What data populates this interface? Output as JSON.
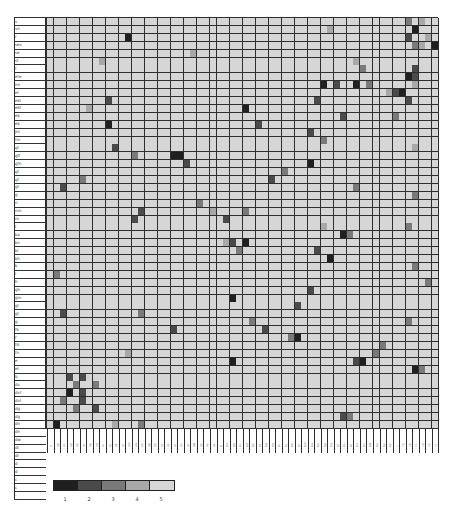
{
  "chart_data": {
    "type": "heatmap",
    "title": "",
    "xlabel": "",
    "ylabel": "",
    "n_rows": 52,
    "n_cols": 60,
    "default_value": 5,
    "row_labels": [
      "s",
      "vn",
      "r",
      "sev",
      "se",
      "st",
      "t",
      "ete",
      "nn",
      "el",
      "ekl",
      "ekt",
      "ek",
      "ek",
      "jm",
      "tm",
      "gl",
      "gfl",
      "gfn",
      "gt",
      "gt",
      "gt",
      "g",
      "n",
      "mn",
      "m",
      "l",
      "ka",
      "kn",
      "kl",
      "kh",
      "k",
      "i",
      "h",
      "gh",
      "gm",
      "gl",
      "gt",
      "g",
      "fk",
      "f",
      "fd",
      "fn",
      "e",
      "el",
      "b",
      "dv",
      "dvt",
      "dvl",
      "dg",
      "dg",
      "dn"
    ],
    "extra_row_labels": [
      "dn",
      "dw",
      "dl",
      "di",
      "d",
      "d",
      "c",
      "c",
      "-"
    ],
    "col_labels": [
      "a",
      "ab",
      "ac",
      "ad",
      "ae",
      "af",
      "ag",
      "ah",
      "ai",
      "aj",
      "ak",
      "al",
      "am",
      "an",
      "ao",
      "ap",
      "aq",
      "ar",
      "as",
      "at",
      "au",
      "av",
      "aw",
      "ax",
      "ay",
      "az",
      "b",
      "ba",
      "bb",
      "bc",
      "bd",
      "be",
      "bf",
      "bg",
      "bh",
      "bi",
      "bj",
      "bk",
      "bl",
      "bm",
      "bn",
      "bo",
      "bp",
      "bq",
      "br",
      "bs",
      "bt",
      "bu",
      "bv",
      "bw",
      "bx",
      "by",
      "bz",
      "c",
      "ca",
      "cb",
      "cc",
      "cd",
      "ce",
      "cf"
    ],
    "legend": {
      "values": [
        1,
        2,
        3,
        4,
        5
      ],
      "labels": [
        "1",
        "2",
        "3",
        "4",
        "5"
      ],
      "colors": [
        "#1f1f1f",
        "#4a4a4a",
        "#7a7a7a",
        "#a8a8a8",
        "#d6d6d6"
      ]
    },
    "cells": [
      [
        0,
        55,
        3
      ],
      [
        0,
        57,
        4
      ],
      [
        1,
        56,
        1
      ],
      [
        1,
        43,
        4
      ],
      [
        2,
        12,
        1
      ],
      [
        2,
        55,
        2
      ],
      [
        2,
        58,
        4
      ],
      [
        3,
        59,
        1
      ],
      [
        3,
        57,
        4
      ],
      [
        3,
        56,
        3
      ],
      [
        4,
        22,
        4
      ],
      [
        5,
        8,
        4
      ],
      [
        5,
        47,
        4
      ],
      [
        6,
        56,
        2
      ],
      [
        6,
        48,
        3
      ],
      [
        7,
        55,
        1
      ],
      [
        7,
        56,
        2
      ],
      [
        8,
        42,
        1
      ],
      [
        8,
        44,
        2
      ],
      [
        8,
        47,
        1
      ],
      [
        8,
        49,
        3
      ],
      [
        8,
        56,
        4
      ],
      [
        9,
        52,
        4
      ],
      [
        9,
        53,
        2
      ],
      [
        9,
        54,
        1
      ],
      [
        10,
        41,
        2
      ],
      [
        10,
        55,
        2
      ],
      [
        10,
        9,
        2
      ],
      [
        11,
        30,
        1
      ],
      [
        11,
        6,
        4
      ],
      [
        12,
        53,
        3
      ],
      [
        12,
        45,
        2
      ],
      [
        13,
        32,
        2
      ],
      [
        13,
        9,
        1
      ],
      [
        14,
        40,
        2
      ],
      [
        15,
        42,
        3
      ],
      [
        16,
        10,
        2
      ],
      [
        16,
        56,
        4
      ],
      [
        17,
        13,
        3
      ],
      [
        17,
        19,
        1
      ],
      [
        17,
        20,
        1
      ],
      [
        18,
        40,
        1
      ],
      [
        18,
        21,
        2
      ],
      [
        19,
        36,
        3
      ],
      [
        20,
        5,
        3
      ],
      [
        20,
        34,
        2
      ],
      [
        21,
        2,
        2
      ],
      [
        21,
        47,
        3
      ],
      [
        22,
        56,
        3
      ],
      [
        23,
        23,
        3
      ],
      [
        24,
        14,
        2
      ],
      [
        24,
        25,
        4
      ],
      [
        24,
        30,
        3
      ],
      [
        25,
        13,
        2
      ],
      [
        25,
        27,
        2
      ],
      [
        26,
        55,
        3
      ],
      [
        26,
        42,
        4
      ],
      [
        27,
        45,
        1
      ],
      [
        27,
        46,
        3
      ],
      [
        28,
        28,
        2
      ],
      [
        28,
        30,
        1
      ],
      [
        28,
        27,
        4
      ],
      [
        29,
        41,
        2
      ],
      [
        29,
        29,
        3
      ],
      [
        30,
        43,
        1
      ],
      [
        31,
        56,
        3
      ],
      [
        32,
        1,
        3
      ],
      [
        33,
        58,
        3
      ],
      [
        34,
        40,
        2
      ],
      [
        35,
        28,
        1
      ],
      [
        36,
        38,
        2
      ],
      [
        37,
        2,
        2
      ],
      [
        37,
        14,
        3
      ],
      [
        38,
        31,
        3
      ],
      [
        38,
        55,
        3
      ],
      [
        39,
        19,
        2
      ],
      [
        39,
        33,
        2
      ],
      [
        40,
        38,
        1
      ],
      [
        40,
        37,
        3
      ],
      [
        41,
        51,
        3
      ],
      [
        42,
        50,
        3
      ],
      [
        42,
        12,
        4
      ],
      [
        43,
        48,
        1
      ],
      [
        43,
        28,
        1
      ],
      [
        43,
        47,
        2
      ],
      [
        44,
        56,
        1
      ],
      [
        44,
        57,
        3
      ],
      [
        45,
        3,
        2
      ],
      [
        45,
        5,
        2
      ],
      [
        46,
        4,
        3
      ],
      [
        46,
        7,
        3
      ],
      [
        47,
        3,
        1
      ],
      [
        47,
        5,
        2
      ],
      [
        48,
        2,
        3
      ],
      [
        48,
        5,
        2
      ],
      [
        49,
        7,
        2
      ],
      [
        49,
        4,
        3
      ],
      [
        50,
        45,
        2
      ],
      [
        50,
        46,
        3
      ],
      [
        51,
        1,
        1
      ],
      [
        51,
        14,
        3
      ],
      [
        51,
        10,
        4
      ]
    ]
  },
  "legend_title": ""
}
